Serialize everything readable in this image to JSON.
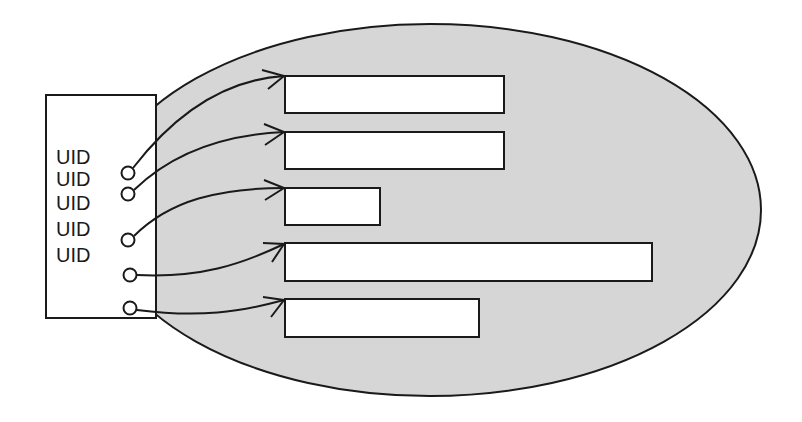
{
  "diagram": {
    "colors": {
      "background": "#ffffff",
      "ellipse_fill": "#d6d6d6",
      "stroke": "#1a1a1a",
      "box_fill": "#ffffff"
    },
    "ellipse": {
      "cx": 430,
      "cy": 210,
      "rx": 331,
      "ry": 186
    },
    "source_box": {
      "x": 46,
      "y": 95,
      "width": 110,
      "height": 223
    },
    "uid_labels": [
      {
        "text": "UID",
        "top": 158
      },
      {
        "text": "UID",
        "top": 184
      },
      {
        "text": "UID",
        "top": 208
      },
      {
        "text": "UID",
        "top": 232
      },
      {
        "text": "UID",
        "top": 258
      }
    ],
    "connectors": [
      {
        "circle": [
          128,
          173
        ],
        "target_rect": {
          "x": 285,
          "y": 76,
          "width": 219,
          "height": 37
        }
      },
      {
        "circle": [
          128,
          194
        ],
        "target_rect": {
          "x": 285,
          "y": 132,
          "width": 219,
          "height": 37
        }
      },
      {
        "circle": [
          128,
          240
        ],
        "target_rect": {
          "x": 285,
          "y": 188,
          "width": 95,
          "height": 37
        }
      },
      {
        "circle": [
          130,
          275
        ],
        "target_rect": {
          "x": 285,
          "y": 243,
          "width": 367,
          "height": 38
        }
      },
      {
        "circle": [
          130,
          308
        ],
        "target_rect": {
          "x": 285,
          "y": 299,
          "width": 194,
          "height": 38
        }
      }
    ]
  }
}
